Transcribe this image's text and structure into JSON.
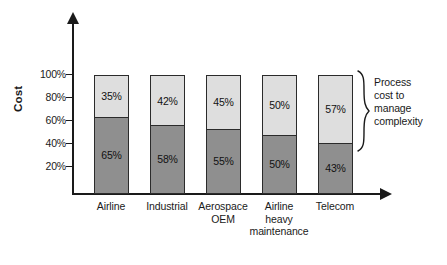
{
  "chart_data": {
    "type": "bar",
    "subtype": "stacked-bar-100-percent",
    "title": "",
    "xlabel": "",
    "ylabel": "Cost",
    "ylim": [
      0,
      100
    ],
    "yticks": [
      "20%",
      "40%",
      "60%",
      "80%",
      "100%"
    ],
    "ytick_values": [
      20,
      40,
      60,
      80,
      100
    ],
    "grid": false,
    "legend_position": "none",
    "categories": [
      "Airline",
      "Industrial",
      "Aerospace\nOEM",
      "Airline\nheavy\nmaintenance",
      "Telecom"
    ],
    "series": [
      {
        "name": "Base cost",
        "color": "#8f8f8f",
        "values": [
          65,
          58,
          55,
          50,
          43
        ],
        "labels": [
          "65%",
          "58%",
          "55%",
          "50%",
          "43%"
        ]
      },
      {
        "name": "Process cost to manage complexity",
        "color": "#dedede",
        "values": [
          35,
          42,
          45,
          50,
          57
        ],
        "labels": [
          "35%",
          "42%",
          "45%",
          "50%",
          "57%"
        ]
      }
    ],
    "annotations": [
      {
        "text": "Process cost to manage complexity",
        "lines": [
          "Process",
          "cost to",
          "manage",
          "complexity"
        ],
        "target": "upper segment of Telecom bar",
        "marker": "curly-brace"
      }
    ]
  },
  "categories_display": [
    {
      "lines": [
        "Airline"
      ]
    },
    {
      "lines": [
        "Industrial"
      ]
    },
    {
      "lines": [
        "Aerospace",
        "OEM"
      ]
    },
    {
      "lines": [
        "Airline",
        "heavy",
        "maintenance"
      ]
    },
    {
      "lines": [
        "Telecom"
      ]
    }
  ],
  "colors": {
    "dark_segment": "#8f8f8f",
    "light_segment": "#dedede",
    "stroke": "#2b2b2b",
    "text": "#1a1a1a",
    "background": "#ffffff"
  }
}
